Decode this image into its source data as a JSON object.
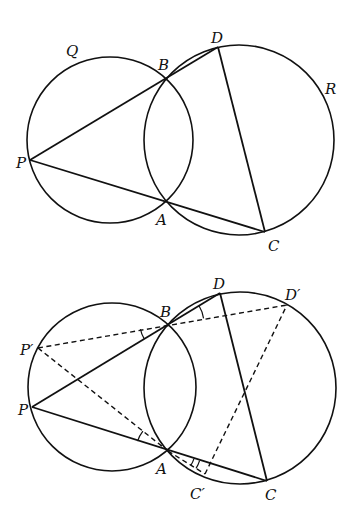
{
  "figures": [
    {
      "name": "top-figure",
      "circles": [
        {
          "name": "Q",
          "label": "Q",
          "cx": 110,
          "cy": 140,
          "r": 83,
          "label_x": 66,
          "label_y": 56
        },
        {
          "name": "R",
          "label": "R",
          "cx": 239,
          "cy": 140,
          "r": 95,
          "label_x": 325,
          "label_y": 94
        }
      ],
      "points": {
        "P": {
          "x": 30,
          "y": 160,
          "label": "P",
          "lx": 16,
          "ly": 168
        },
        "B": {
          "x": 166,
          "y": 78,
          "label": "B",
          "lx": 158,
          "ly": 70
        },
        "A": {
          "x": 166,
          "y": 202,
          "label": "A",
          "lx": 156,
          "ly": 225
        },
        "D": {
          "x": 218,
          "y": 47,
          "label": "D",
          "lx": 211,
          "ly": 43
        },
        "C": {
          "x": 265,
          "y": 232,
          "label": "C",
          "lx": 268,
          "ly": 251
        }
      },
      "solid_segments": [
        [
          "P",
          "D"
        ],
        [
          "P",
          "C"
        ],
        [
          "D",
          "C"
        ]
      ],
      "dashed_segments": [],
      "angle_marks": []
    },
    {
      "name": "bottom-figure",
      "circles": [
        {
          "name": "Q",
          "label": "",
          "cx": 112,
          "cy": 387,
          "r": 84,
          "label_x": 0,
          "label_y": 0
        },
        {
          "name": "R",
          "label": "",
          "cx": 240,
          "cy": 388,
          "r": 96,
          "label_x": 0,
          "label_y": 0
        }
      ],
      "points": {
        "P": {
          "x": 32,
          "y": 407,
          "label": "P",
          "lx": 18,
          "ly": 415
        },
        "P'": {
          "x": 38,
          "y": 348,
          "label": "P′",
          "lx": 20,
          "ly": 355
        },
        "B": {
          "x": 168,
          "y": 324,
          "label": "B",
          "lx": 160,
          "ly": 317
        },
        "A": {
          "x": 168,
          "y": 451,
          "label": "A",
          "lx": 156,
          "ly": 474
        },
        "D": {
          "x": 220,
          "y": 293,
          "label": "D",
          "lx": 213,
          "ly": 289
        },
        "D'": {
          "x": 287,
          "y": 305,
          "label": "D′",
          "lx": 285,
          "ly": 300
        },
        "C": {
          "x": 267,
          "y": 481,
          "label": "C",
          "lx": 265,
          "ly": 500
        },
        "C'": {
          "x": 205,
          "y": 474,
          "label": "C′",
          "lx": 190,
          "ly": 499
        }
      },
      "solid_segments": [
        [
          "P",
          "D"
        ],
        [
          "P",
          "C"
        ],
        [
          "D",
          "C"
        ]
      ],
      "dashed_segments": [
        [
          "P'",
          "D'"
        ],
        [
          "P'",
          "A"
        ],
        [
          "A",
          "C'"
        ],
        [
          "C'",
          "D'"
        ]
      ],
      "angle_marks": [
        {
          "vertex": "B",
          "from": "P'",
          "to": "P",
          "r": 28
        },
        {
          "vertex": "A",
          "from": "P",
          "to": "P'",
          "r": 32
        },
        {
          "vertex": "B",
          "from": "D",
          "to": "D'",
          "r": 36
        },
        {
          "vertex": "A",
          "from": "C'",
          "to": "C",
          "r": 27
        },
        {
          "vertex": "A",
          "from": "C'",
          "to": "C",
          "r": 33
        }
      ]
    }
  ]
}
